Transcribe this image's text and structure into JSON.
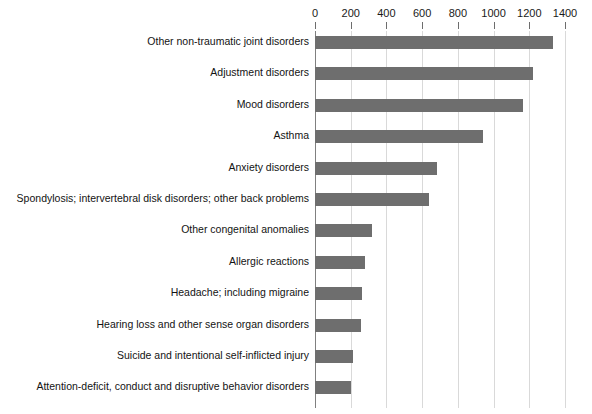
{
  "chart_data": {
    "type": "bar",
    "orientation": "horizontal",
    "title": "",
    "subtitle": "",
    "xlabel": "",
    "ylabel": "",
    "xlim": [
      0,
      1400
    ],
    "xticks": [
      0,
      200,
      400,
      600,
      800,
      1000,
      1200,
      1400
    ],
    "xtick_labels": [
      "0",
      "200",
      "400",
      "600",
      "800",
      "1000",
      "1200",
      "1400"
    ],
    "grid": true,
    "legend": null,
    "legend_position": "none",
    "bar_color": "#6e6e6e",
    "gridline_color": "#d9d9d9",
    "axis_color": "#808080",
    "categories": [
      "Other non-traumatic joint disorders",
      "Adjustment disorders",
      "Mood disorders",
      "Asthma",
      "Anxiety disorders",
      "Spondylosis; intervertebral disk disorders; other back problems",
      "Other congenital anomalies",
      "Allergic reactions",
      "Headache; including migraine",
      "Hearing loss and other sense organ disorders",
      "Suicide and intentional self-inflicted injury",
      "Attention-deficit, conduct and disruptive behavior disorders"
    ],
    "values": [
      1331,
      1222,
      1162,
      939,
      681,
      638,
      318,
      280,
      265,
      255,
      212,
      204
    ]
  }
}
